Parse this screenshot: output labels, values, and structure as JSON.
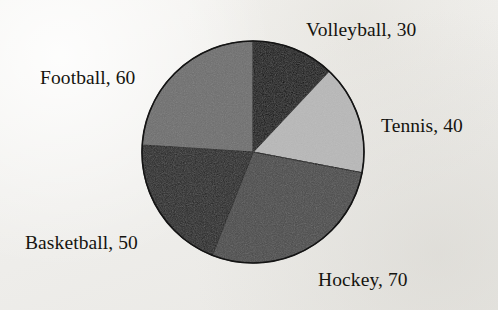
{
  "figure": {
    "background_color": "#f2f1ee",
    "text_color": "#15140f",
    "outline_color": "#161616"
  },
  "labels": {
    "volleyball": "Volleyball, 30",
    "tennis": "Tennis, 40",
    "hockey": "Hockey, 70",
    "basketball": "Basketball, 50",
    "football": "Football, 60"
  },
  "chart_data": {
    "type": "pie",
    "title": "",
    "subtitle": "",
    "xlabel": "",
    "ylabel": "",
    "grid": false,
    "legend": false,
    "legend_position": "none",
    "label_format": "{category}, {value}",
    "total": 250,
    "start_angle_deg": 0,
    "direction": "clockwise",
    "center": [
      253,
      152
    ],
    "radius": 111,
    "categories": [
      "Volleyball",
      "Tennis",
      "Hockey",
      "Basketball",
      "Football"
    ],
    "values": [
      30,
      40,
      70,
      50,
      60
    ],
    "percentages": [
      12,
      16,
      28,
      20,
      24
    ],
    "angles_deg": [
      43.2,
      57.6,
      100.8,
      72,
      86.4
    ],
    "colors": [
      "#0d0d0d",
      "#b8b8b8",
      "#4a4a4a",
      "#232323",
      "#6e6e6e"
    ],
    "slices": [
      {
        "category": "Volleyball",
        "value": 30,
        "percent": 12,
        "angle_deg": 43.2,
        "color": "#0d0d0d",
        "label": "Volleyball, 30"
      },
      {
        "category": "Tennis",
        "value": 40,
        "percent": 16,
        "angle_deg": 57.6,
        "color": "#b8b8b8",
        "label": "Tennis, 40"
      },
      {
        "category": "Hockey",
        "value": 70,
        "percent": 28,
        "angle_deg": 100.8,
        "color": "#4a4a4a",
        "label": "Hockey, 70"
      },
      {
        "category": "Basketball",
        "value": 50,
        "percent": 20,
        "angle_deg": 72,
        "color": "#232323",
        "label": "Basketball, 50"
      },
      {
        "category": "Football",
        "value": 60,
        "percent": 24,
        "angle_deg": 86.4,
        "color": "#6e6e6e",
        "label": "Football, 60"
      }
    ]
  }
}
